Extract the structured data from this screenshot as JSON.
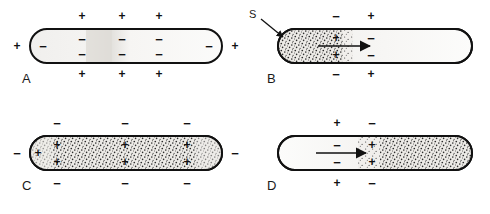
{
  "figure": {
    "width": 490,
    "height": 214,
    "background_color": "#ffffff",
    "line_color": "#111111",
    "sign_color": "#111111"
  },
  "symbols": {
    "plus": "+",
    "minus": "−",
    "stimulus_label": "S"
  },
  "panels": [
    {
      "id": "A",
      "label": "A",
      "label_x": 22,
      "label_y": 78,
      "caption": "Resting membrane: outside positive, inside negative",
      "capsule": {
        "x": 30,
        "y": 29,
        "width": 192,
        "height": 34,
        "fill": "#f2f1ef"
      },
      "stipple_regions": [],
      "shading": "light-uniform",
      "arrow": null,
      "stimulus_arrow": null,
      "signs": [
        {
          "sign": "+",
          "x": 82,
          "y": 16,
          "where": "outside-top"
        },
        {
          "sign": "+",
          "x": 122,
          "y": 16,
          "where": "outside-top"
        },
        {
          "sign": "+",
          "x": 159,
          "y": 16,
          "where": "outside-top"
        },
        {
          "sign": "+",
          "x": 82,
          "y": 74,
          "where": "outside-bottom"
        },
        {
          "sign": "+",
          "x": 122,
          "y": 74,
          "where": "outside-bottom"
        },
        {
          "sign": "+",
          "x": 159,
          "y": 74,
          "where": "outside-bottom"
        },
        {
          "sign": "+",
          "x": 17,
          "y": 46,
          "where": "outside-left"
        },
        {
          "sign": "+",
          "x": 235,
          "y": 46,
          "where": "outside-right"
        },
        {
          "sign": "−",
          "x": 43,
          "y": 46,
          "where": "inside"
        },
        {
          "sign": "−",
          "x": 82,
          "y": 39,
          "where": "inside"
        },
        {
          "sign": "−",
          "x": 122,
          "y": 39,
          "where": "inside"
        },
        {
          "sign": "−",
          "x": 159,
          "y": 39,
          "where": "inside"
        },
        {
          "sign": "−",
          "x": 82,
          "y": 54,
          "where": "inside"
        },
        {
          "sign": "−",
          "x": 122,
          "y": 54,
          "where": "inside"
        },
        {
          "sign": "−",
          "x": 159,
          "y": 54,
          "where": "inside"
        },
        {
          "sign": "−",
          "x": 209,
          "y": 46,
          "where": "inside"
        }
      ]
    },
    {
      "id": "B",
      "label": "B",
      "label_x": 267,
      "label_y": 78,
      "caption": "Stimulus S depolarizes the left end; impulse begins to travel right",
      "capsule": {
        "x": 278,
        "y": 29,
        "width": 194,
        "height": 34,
        "fill": "#f4f3f1"
      },
      "stipple_regions": [
        {
          "x": 278,
          "y": 29,
          "width": 72,
          "height": 34,
          "density": "high"
        }
      ],
      "shading": "stipple-left",
      "arrow": {
        "x1": 318,
        "y1": 46,
        "x2": 372,
        "y2": 46,
        "direction": "right"
      },
      "stimulus_arrow": {
        "label": "S",
        "label_x": 252,
        "label_y": 12,
        "x1": 262,
        "y1": 20,
        "x2": 284,
        "y2": 38
      },
      "signs": [
        {
          "sign": "−",
          "x": 336,
          "y": 16,
          "where": "outside-top"
        },
        {
          "sign": "+",
          "x": 371,
          "y": 16,
          "where": "outside-top"
        },
        {
          "sign": "−",
          "x": 336,
          "y": 74,
          "where": "outside-bottom"
        },
        {
          "sign": "+",
          "x": 371,
          "y": 74,
          "where": "outside-bottom"
        },
        {
          "sign": "+",
          "x": 336,
          "y": 38,
          "where": "inside"
        },
        {
          "sign": "+",
          "x": 336,
          "y": 55,
          "where": "inside"
        },
        {
          "sign": "−",
          "x": 371,
          "y": 38,
          "where": "inside"
        },
        {
          "sign": "−",
          "x": 371,
          "y": 55,
          "where": "inside"
        }
      ]
    },
    {
      "id": "C",
      "label": "C",
      "label_x": 22,
      "label_y": 185,
      "caption": "Fully depolarized membrane: outside negative, inside positive",
      "capsule": {
        "x": 30,
        "y": 136,
        "width": 192,
        "height": 34,
        "fill": "#e9e7e3"
      },
      "stipple_regions": [
        {
          "x": 30,
          "y": 136,
          "width": 192,
          "height": 34,
          "density": "high"
        }
      ],
      "shading": "stipple-full",
      "arrow": null,
      "stimulus_arrow": null,
      "signs": [
        {
          "sign": "−",
          "x": 57,
          "y": 123,
          "where": "outside-top"
        },
        {
          "sign": "−",
          "x": 125,
          "y": 123,
          "where": "outside-top"
        },
        {
          "sign": "−",
          "x": 187,
          "y": 123,
          "where": "outside-top"
        },
        {
          "sign": "−",
          "x": 57,
          "y": 183,
          "where": "outside-bottom"
        },
        {
          "sign": "−",
          "x": 125,
          "y": 183,
          "where": "outside-bottom"
        },
        {
          "sign": "−",
          "x": 187,
          "y": 183,
          "where": "outside-bottom"
        },
        {
          "sign": "−",
          "x": 17,
          "y": 153,
          "where": "outside-left"
        },
        {
          "sign": "−",
          "x": 235,
          "y": 153,
          "where": "outside-right"
        },
        {
          "sign": "+",
          "x": 38,
          "y": 153,
          "where": "inside"
        },
        {
          "sign": "+",
          "x": 57,
          "y": 145,
          "where": "inside"
        },
        {
          "sign": "+",
          "x": 57,
          "y": 162,
          "where": "inside"
        },
        {
          "sign": "+",
          "x": 125,
          "y": 145,
          "where": "inside"
        },
        {
          "sign": "+",
          "x": 125,
          "y": 162,
          "where": "inside"
        },
        {
          "sign": "+",
          "x": 187,
          "y": 145,
          "where": "inside"
        },
        {
          "sign": "+",
          "x": 187,
          "y": 162,
          "where": "inside"
        }
      ]
    },
    {
      "id": "D",
      "label": "D",
      "label_x": 267,
      "label_y": 185,
      "caption": "Impulse travelling rightward; depolarized zone advances",
      "capsule": {
        "x": 278,
        "y": 136,
        "width": 194,
        "height": 34,
        "fill": "#f4f3f1"
      },
      "stipple_regions": [
        {
          "x": 380,
          "y": 136,
          "width": 92,
          "height": 34,
          "density": "high"
        }
      ],
      "shading": "stipple-right",
      "arrow": {
        "x1": 316,
        "y1": 153,
        "x2": 368,
        "y2": 153,
        "direction": "right"
      },
      "stimulus_arrow": null,
      "signs": [
        {
          "sign": "+",
          "x": 337,
          "y": 123,
          "where": "outside-top"
        },
        {
          "sign": "−",
          "x": 372,
          "y": 123,
          "where": "outside-top"
        },
        {
          "sign": "+",
          "x": 337,
          "y": 183,
          "where": "outside-bottom"
        },
        {
          "sign": "−",
          "x": 372,
          "y": 183,
          "where": "outside-bottom"
        },
        {
          "sign": "−",
          "x": 337,
          "y": 145,
          "where": "inside"
        },
        {
          "sign": "−",
          "x": 337,
          "y": 162,
          "where": "inside"
        },
        {
          "sign": "+",
          "x": 372,
          "y": 145,
          "where": "inside"
        },
        {
          "sign": "+",
          "x": 372,
          "y": 162,
          "where": "inside"
        }
      ]
    }
  ]
}
